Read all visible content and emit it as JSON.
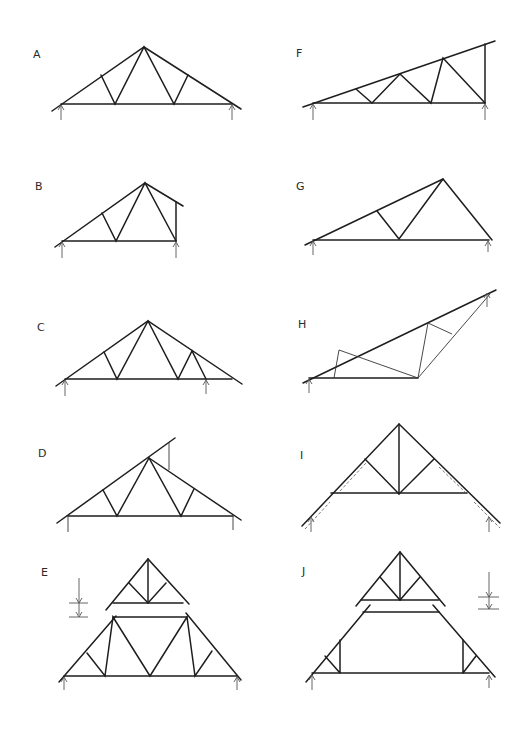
{
  "figure": {
    "background": "#ffffff",
    "line_color": "#1e1e1e",
    "trusses": [
      {
        "id": "A",
        "label": "A",
        "type": "symmetric fink (W) truss"
      },
      {
        "id": "B",
        "label": "B",
        "type": "asymmetric truss with short vertical end"
      },
      {
        "id": "C",
        "label": "C",
        "type": "symmetric truss with cantilevered support"
      },
      {
        "id": "D",
        "label": "D",
        "type": "truss with raised upper chord extension"
      },
      {
        "id": "E",
        "label": "E",
        "type": "two-part truss with separate cap and dimension marker"
      },
      {
        "id": "F",
        "label": "F",
        "type": "mono-pitch truss"
      },
      {
        "id": "G",
        "label": "G",
        "type": "asymmetric dual-pitch truss"
      },
      {
        "id": "H",
        "label": "H",
        "type": "scissor-like inclined truss"
      },
      {
        "id": "I",
        "label": "I",
        "type": "raised tie truss with overhanging rafters"
      },
      {
        "id": "J",
        "label": "J",
        "type": "attic (room-in-roof) truss with separate cap and dimension marker"
      }
    ]
  }
}
